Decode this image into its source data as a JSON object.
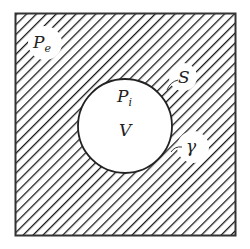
{
  "diagram": {
    "labels": {
      "external_pressure": "P",
      "external_pressure_sub": "e",
      "internal_pressure": "P",
      "internal_pressure_sub": "i",
      "volume": "V",
      "surface": "S",
      "surface_tension": "γ"
    },
    "colors": {
      "hatch": "#1a1a1a",
      "border": "#333333",
      "background": "#ffffff"
    }
  }
}
